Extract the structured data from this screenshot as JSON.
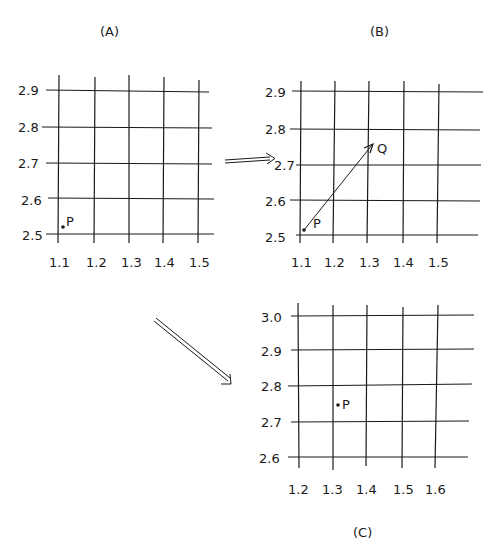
{
  "panels": {
    "A": {
      "title": "(A)",
      "y_ticks": [
        "2.9",
        "2.8",
        "2.7",
        "2.6",
        "2.5"
      ],
      "x_ticks": [
        "1.1",
        "1.2",
        "1.3",
        "1.4",
        "1.5"
      ],
      "point_label": "P"
    },
    "B": {
      "title": "(B)",
      "y_ticks": [
        "2.9",
        "2.8",
        "2.7",
        "2.6",
        "2.5"
      ],
      "x_ticks": [
        "1.1",
        "1.2",
        "1.3",
        "1.4",
        "1.5"
      ],
      "start_label": "P",
      "end_label": "Q"
    },
    "C": {
      "title": "(C)",
      "y_ticks": [
        "3.0",
        "2.9",
        "2.8",
        "2.7",
        "2.6"
      ],
      "x_ticks": [
        "1.2",
        "1.3",
        "1.4",
        "1.5",
        "1.6"
      ],
      "point_label": "P"
    }
  },
  "arrows": {
    "a_to_b": "double-arrow-right",
    "a_to_c": "double-arrow-down-right"
  },
  "colors": {
    "ink": "#1a1a1a",
    "background": "#ffffff"
  }
}
